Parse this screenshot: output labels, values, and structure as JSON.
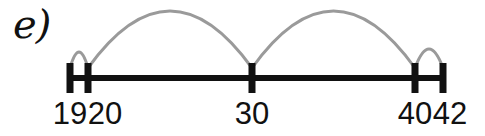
{
  "figure": {
    "part_label": "e)",
    "background_color": "#ffffff",
    "line_color": "#111111",
    "tick_color": "#111111",
    "arc_color": "#9a9a9a",
    "label_color": "#111111",
    "width": 485,
    "height": 136
  },
  "axis": {
    "y": 78,
    "x_start": 70,
    "x_end": 443,
    "thickness": 6
  },
  "ticks": [
    {
      "label": "19",
      "x": 70,
      "label_x": 70,
      "label_y": 98
    },
    {
      "label": "20",
      "x": 88,
      "label_x": 105,
      "label_y": 98
    },
    {
      "label": "30",
      "x": 252,
      "label_x": 252,
      "label_y": 98
    },
    {
      "label": "40",
      "x": 415,
      "label_x": 415,
      "label_y": 98
    },
    {
      "label": "42",
      "x": 443,
      "label_x": 450,
      "label_y": 98
    }
  ],
  "jumps": [
    {
      "from": "19",
      "to": "20",
      "from_x": 70,
      "to_x": 88,
      "peak_y": 52,
      "size": "small"
    },
    {
      "from": "20",
      "to": "30",
      "from_x": 88,
      "to_x": 252,
      "peak_y": 11,
      "size": "large"
    },
    {
      "from": "30",
      "to": "40",
      "from_x": 252,
      "to_x": 415,
      "peak_y": 11,
      "size": "large"
    },
    {
      "from": "40",
      "to": "42",
      "from_x": 415,
      "to_x": 443,
      "peak_y": 49,
      "size": "small"
    }
  ],
  "chart_data": {
    "type": "line",
    "title": "e)",
    "xlabel": "",
    "ylabel": "",
    "categories": [
      "19",
      "20",
      "30",
      "40",
      "42"
    ],
    "values": [
      19,
      20,
      30,
      40,
      42
    ],
    "x": [
      19,
      20,
      30,
      40,
      42
    ],
    "annotations": [
      "jump 19 to 20",
      "jump 20 to 30",
      "jump 30 to 40",
      "jump 40 to 42"
    ],
    "xlim": [
      19,
      42
    ],
    "grid": false,
    "legend": "none"
  }
}
